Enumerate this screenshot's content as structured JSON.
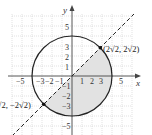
{
  "diagram": {
    "type": "coordinate-graph",
    "axes": {
      "x_label": "x",
      "y_label": "y",
      "x_tick_labels": [
        "−5",
        "−3",
        "−2",
        "−1",
        "1",
        "2",
        "3",
        "5"
      ],
      "y_tick_labels": [
        "5",
        "3",
        "2",
        "1",
        "−1",
        "−2",
        "−3",
        "−5"
      ]
    },
    "circle": {
      "center": [
        0,
        0
      ],
      "radius": 4
    },
    "line": {
      "equation": "y = x",
      "style": "dashed"
    },
    "points": [
      {
        "label": "(2√2, 2√2)",
        "x": 2.83,
        "y": 2.83
      },
      {
        "label": "(−2√2, −2√2)",
        "x": -2.83,
        "y": -2.83
      }
    ],
    "shaded_region": "inside circle, below line y = x, right of y-axis and below x-axis portions",
    "colors": {
      "grid": "#c8c8c8",
      "shade": "#e2e2e2",
      "stroke": "#222222"
    }
  }
}
